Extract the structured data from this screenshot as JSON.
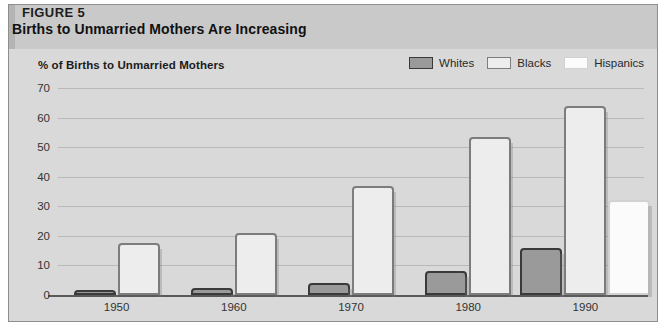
{
  "figure": {
    "label": "FIGURE 5",
    "title": "Births to Unmarried Mothers Are Increasing"
  },
  "colors": {
    "panel_background": "#d9d9d9",
    "header_background": "#c9c9c9",
    "whites_fill": "#9a9a9a",
    "blacks_fill": "#ededed",
    "hispanics_fill": "#fbfbfb",
    "gridline": "#b9b9b9",
    "axis": "#5a5a5a"
  },
  "chart_data": {
    "type": "bar",
    "title": "Births to Unmarried Mothers Are Increasing",
    "subtitle": "FIGURE 5",
    "ylabel": "% of Births to Unmarried Mothers",
    "xlabel": "",
    "categories": [
      "1950",
      "1960",
      "1970",
      "1980",
      "1990"
    ],
    "series": [
      {
        "name": "Whites",
        "values": [
          1.7,
          2.3,
          4,
          8,
          16
        ]
      },
      {
        "name": "Blacks",
        "values": [
          17.7,
          21,
          36.7,
          53.4,
          64
        ]
      },
      {
        "name": "Hispanics",
        "values": [
          null,
          null,
          null,
          null,
          32
        ]
      }
    ],
    "ylim": [
      0,
      70
    ],
    "yticks": [
      0,
      10,
      20,
      30,
      40,
      50,
      60,
      70
    ],
    "ytick_labels": [
      "0",
      "10",
      "20",
      "30",
      "40",
      "50",
      "60",
      "70"
    ],
    "grid": true,
    "legend": [
      "Whites",
      "Blacks",
      "Hispanics"
    ],
    "legend_position": "top-right"
  }
}
